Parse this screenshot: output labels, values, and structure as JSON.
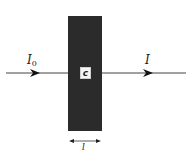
{
  "diagram": {
    "incident_label": "I",
    "incident_subscript": "0",
    "transmitted_label": "I",
    "concentration_label": "c",
    "path_length_label": "l",
    "colors": {
      "slab": "#2b2b2b",
      "beam": "#333333",
      "label_box": "#f4f4f4",
      "background": "#ffffff"
    }
  }
}
